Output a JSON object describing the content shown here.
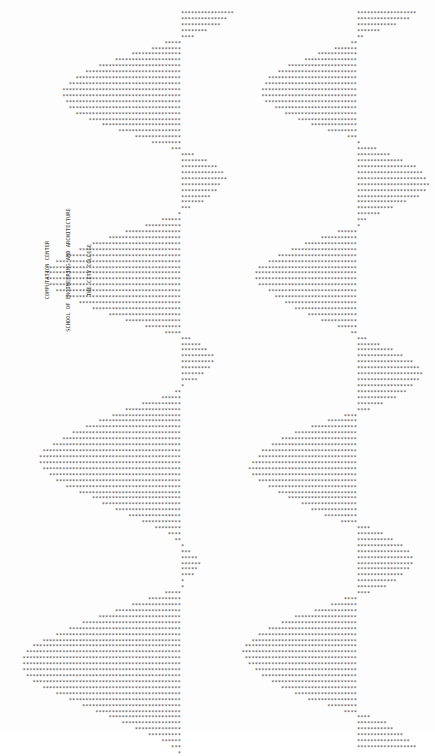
{
  "document": {
    "caption_lines": [
      "COMPUTATION CENTER",
      "SCHOOL OF ENGINEERING AND ARCHITECTURE",
      "THE CITY COLLEGE"
    ],
    "plot_glyph": "*"
  },
  "chart_data": {
    "type": "bar",
    "title": "",
    "series": [
      {
        "name": "left-column",
        "values": [
          16,
          14,
          12,
          8,
          4,
          -5,
          -9,
          -15,
          -20,
          -25,
          -29,
          -32,
          -34,
          -36,
          -36,
          -35,
          -34,
          -32,
          -28,
          -24,
          -19,
          -14,
          -9,
          -3,
          4,
          8,
          11,
          13,
          14,
          12,
          11,
          9,
          7,
          3,
          -1,
          -6,
          -11,
          -17,
          -22,
          -27,
          -31,
          -35,
          -38,
          -40,
          -41,
          -41,
          -40,
          -38,
          -35,
          -31,
          -27,
          -22,
          -17,
          -11,
          -5,
          3,
          6,
          8,
          10,
          10,
          9,
          7,
          5,
          1,
          -2,
          -6,
          -12,
          -17,
          -21,
          -25,
          -29,
          -33,
          -36,
          -39,
          -42,
          -43,
          -43,
          -42,
          -40,
          -38,
          -35,
          -31,
          -27,
          -24,
          -20,
          -16,
          -12,
          -8,
          -4,
          -2,
          1,
          3,
          5,
          6,
          5,
          4,
          1,
          1,
          -5,
          -10,
          -15,
          -20,
          -25,
          -30,
          -34,
          -38,
          -42,
          -45,
          -47,
          -48,
          -48,
          -48,
          -47,
          -45,
          -42,
          -38,
          -34,
          -30,
          -26,
          -22,
          -18,
          -14,
          -10,
          -6,
          -3,
          -1
        ]
      },
      {
        "name": "right-column",
        "values": [
          18,
          16,
          12,
          7,
          2,
          -2,
          -7,
          -12,
          -16,
          -21,
          -24,
          -27,
          -28,
          -29,
          -29,
          -28,
          -25,
          -22,
          -18,
          -14,
          -9,
          -3,
          1,
          6,
          10,
          14,
          18,
          20,
          21,
          22,
          21,
          19,
          15,
          11,
          7,
          3,
          1,
          -6,
          -11,
          -16,
          -20,
          -24,
          -27,
          -30,
          -31,
          -31,
          -30,
          -27,
          -25,
          -22,
          -19,
          -15,
          -11,
          -6,
          -2,
          3,
          7,
          11,
          14,
          17,
          19,
          20,
          19,
          17,
          15,
          12,
          8,
          4,
          -4,
          -9,
          -14,
          -19,
          -23,
          -26,
          -29,
          -30,
          -32,
          -33,
          -32,
          -30,
          -27,
          -24,
          -21,
          -17,
          -14,
          -10,
          -5,
          4,
          8,
          11,
          14,
          16,
          17,
          17,
          16,
          14,
          12,
          9,
          4,
          -4,
          -8,
          -13,
          -19,
          -23,
          -27,
          -30,
          -32,
          -34,
          -35,
          -34,
          -33,
          -31,
          -29,
          -26,
          -23,
          -19,
          -15,
          -9,
          -4,
          4,
          9,
          11,
          14,
          16,
          18
        ]
      }
    ],
    "layout": {
      "left_axis_x": 181,
      "right_axis_x": 357,
      "row_pitch_px": 5.92,
      "char_pitch_px": 3.3,
      "first_row_y": 10,
      "grid": false,
      "legend": "none"
    }
  }
}
